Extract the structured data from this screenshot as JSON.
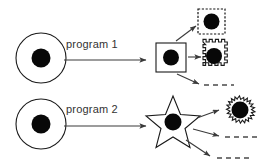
{
  "figure": {
    "background_color": "#ffffff",
    "stroke_color": "#1a1a1a",
    "dot_color": "#080808",
    "arrow_color": "#3a3a3a"
  },
  "rows": [
    {
      "id": "row-1",
      "label": "program",
      "number": "1",
      "source_shape": "circle",
      "intermediate_shape": "square",
      "outputs": [
        {
          "shape": "dashed-square",
          "has_nucleus": true
        },
        {
          "shape": "crenellated-square",
          "has_nucleus": true
        },
        {
          "shape": "dashed-line",
          "has_nucleus": false
        }
      ]
    },
    {
      "id": "row-2",
      "label": "program",
      "number": "2",
      "source_shape": "circle",
      "intermediate_shape": "star",
      "outputs": [
        {
          "shape": "irregular-blob",
          "has_nucleus": true
        },
        {
          "shape": "dashed-line",
          "has_nucleus": false
        },
        {
          "shape": "dashed-line",
          "has_nucleus": false
        }
      ]
    }
  ],
  "labels": {
    "program_1": "program   1",
    "program_2": "program   2"
  }
}
